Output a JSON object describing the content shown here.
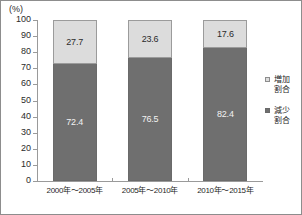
{
  "chart_data": {
    "type": "bar",
    "subtype": "stacked-100-percent",
    "title": "",
    "xlabel": "",
    "ylabel": "",
    "unit_label": "(%)",
    "ylim": [
      0,
      100
    ],
    "ytick_labels": [
      "100",
      "90",
      "80",
      "70",
      "60",
      "50",
      "40",
      "30",
      "20",
      "10",
      "0"
    ],
    "ytick_values": [
      100,
      90,
      80,
      70,
      60,
      50,
      40,
      30,
      20,
      10,
      0
    ],
    "grid": false,
    "legend_position": "right",
    "categories": [
      "2000年～2005年",
      "2005年～2010年",
      "2010年～2015年"
    ],
    "series": [
      {
        "name": "増加割合",
        "color": "#dcdcdc",
        "values": [
          27.7,
          23.6,
          17.6
        ],
        "labels": [
          "27.7",
          "23.6",
          "17.6"
        ]
      },
      {
        "name": "減少割合",
        "color": "#6f6f6f",
        "values": [
          72.4,
          76.5,
          82.4
        ],
        "labels": [
          "72.4",
          "76.5",
          "82.4"
        ]
      }
    ]
  },
  "legend": {
    "items": [
      {
        "label_line1": "増加",
        "label_line2": "割合",
        "swatch": "light-gray-swatch"
      },
      {
        "label_line1": "減少",
        "label_line2": "割合",
        "swatch": "dark-gray-swatch"
      }
    ]
  }
}
